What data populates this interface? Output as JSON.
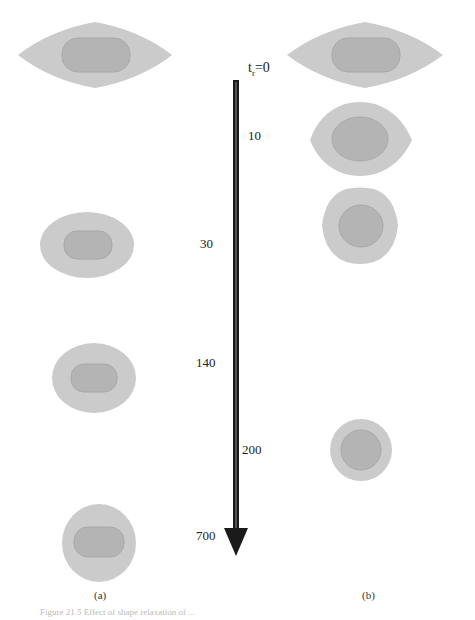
{
  "figure": {
    "time_axis": {
      "start_label": "t_r=0",
      "ticks": [
        "10",
        "30",
        "140",
        "200",
        "700"
      ],
      "arrow_direction": "down"
    },
    "panels": [
      {
        "label": "(a)",
        "snapshots_at": [
          "0",
          "30",
          "140",
          "700"
        ]
      },
      {
        "label": "(b)",
        "snapshots_at": [
          "0",
          "10",
          "30",
          "200"
        ]
      }
    ],
    "colors": {
      "outer_shell": "#c8c8c8",
      "inner_core": "#b2b2b2",
      "arrow": "#1a1a1a"
    },
    "caption": "Figure 21.5  Effect of shape relaxation of ..."
  }
}
